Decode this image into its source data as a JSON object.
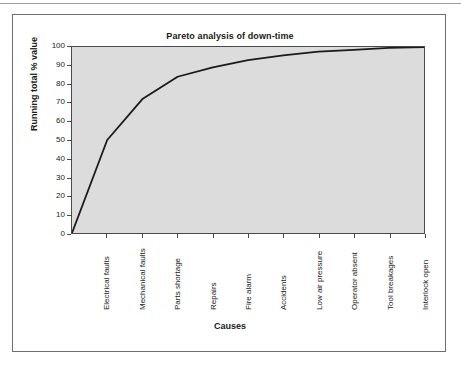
{
  "chart_data": {
    "type": "line",
    "title": "Pareto analysis of down-time",
    "xlabel": "Causes",
    "ylabel": "Running total % value",
    "categories": [
      "Electrical faults",
      "Mechanical faults",
      "Parts shortage",
      "Repairs",
      "Fire alarm",
      "Accidents",
      "Low air pressure",
      "Operator absent",
      "Tool breakages",
      "Interlock open"
    ],
    "values": [
      50,
      72,
      84,
      89,
      93,
      95.5,
      97.5,
      98.5,
      99.5,
      100
    ],
    "origin_value": 0,
    "ylim": [
      0,
      100
    ],
    "yticks": [
      0,
      10,
      20,
      30,
      40,
      50,
      60,
      70,
      80,
      90,
      100
    ],
    "ytick_labels": [
      "0",
      "10",
      "20",
      "30",
      "40",
      "50",
      "60",
      "70",
      "80",
      "90",
      "100"
    ],
    "grid": false,
    "legend": false,
    "series_name": "Running total % value",
    "line_color": "#1a1a1a",
    "plot_background": "#dcdcdc",
    "frame_color": "#4a4a4a"
  }
}
